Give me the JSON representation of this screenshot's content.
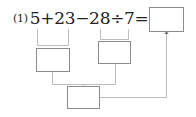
{
  "problem": {
    "number": "(1)",
    "expression": "5+23−28÷7="
  },
  "boxes": {
    "answer": "",
    "step_5_plus_23": "",
    "step_28_div_7": "",
    "step_combined": ""
  },
  "colors": {
    "text": "#222222",
    "line": "#bdbdbd",
    "box_border": "#8c8c8c"
  }
}
